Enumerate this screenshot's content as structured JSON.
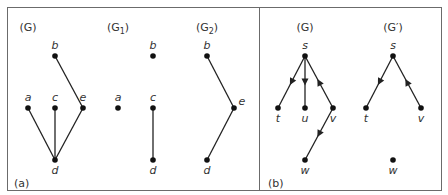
{
  "colors": {
    "border": "#6b6b6b",
    "edge": "#222222",
    "node": "#111111",
    "text": "#333333"
  },
  "panels": [
    {
      "id": "a",
      "caption": "(a)",
      "caption_pos": [
        14,
        178
      ],
      "frame": [
        7,
        7,
        259,
        190
      ]
    },
    {
      "id": "b",
      "caption": "(b)",
      "caption_pos": [
        268,
        178
      ],
      "frame": [
        259,
        7,
        441,
        190
      ]
    }
  ],
  "graphs": [
    {
      "title": "(G)",
      "title_main": "(G",
      "title_sub": "",
      "title_end": ")",
      "title_pos": [
        28,
        22
      ],
      "nodes": [
        {
          "id": "b",
          "x": 55,
          "y": 56,
          "label_pos": "above"
        },
        {
          "id": "a",
          "x": 28,
          "y": 108,
          "label_pos": "above"
        },
        {
          "id": "c",
          "x": 55,
          "y": 108,
          "label_pos": "above"
        },
        {
          "id": "e",
          "x": 83,
          "y": 108,
          "label_pos": "above"
        },
        {
          "id": "d",
          "x": 55,
          "y": 160,
          "label_pos": "below"
        }
      ],
      "edges": [
        {
          "from": "b",
          "to": "e",
          "directed": false
        },
        {
          "from": "a",
          "to": "d",
          "directed": false
        },
        {
          "from": "c",
          "to": "d",
          "directed": false
        },
        {
          "from": "e",
          "to": "d",
          "directed": false
        }
      ]
    },
    {
      "title": "(G1)",
      "title_main": "(G",
      "title_sub": "1",
      "title_end": ")",
      "title_pos": [
        118,
        22
      ],
      "nodes": [
        {
          "id": "b",
          "x": 153,
          "y": 56,
          "label_pos": "above"
        },
        {
          "id": "a",
          "x": 118,
          "y": 108,
          "label_pos": "above"
        },
        {
          "id": "c",
          "x": 153,
          "y": 108,
          "label_pos": "above"
        },
        {
          "id": "d",
          "x": 153,
          "y": 160,
          "label_pos": "below"
        }
      ],
      "edges": [
        {
          "from": "c",
          "to": "d",
          "directed": false
        }
      ]
    },
    {
      "title": "(G2)",
      "title_main": "(G",
      "title_sub": "2",
      "title_end": ")",
      "title_pos": [
        207,
        22
      ],
      "nodes": [
        {
          "id": "b",
          "x": 207,
          "y": 56,
          "label_pos": "above"
        },
        {
          "id": "e",
          "x": 234,
          "y": 108,
          "label_pos": "right"
        },
        {
          "id": "d",
          "x": 207,
          "y": 160,
          "label_pos": "below"
        }
      ],
      "edges": [
        {
          "from": "b",
          "to": "e",
          "directed": false
        },
        {
          "from": "e",
          "to": "d",
          "directed": false
        }
      ]
    },
    {
      "title": "(G)",
      "title_main": "(G",
      "title_sub": "",
      "title_end": ")",
      "title_pos": [
        305,
        22
      ],
      "nodes": [
        {
          "id": "s",
          "x": 305,
          "y": 56,
          "label_pos": "above"
        },
        {
          "id": "t",
          "x": 278,
          "y": 108,
          "label_pos": "below"
        },
        {
          "id": "u",
          "x": 305,
          "y": 108,
          "label_pos": "below"
        },
        {
          "id": "v",
          "x": 333,
          "y": 108,
          "label_pos": "below"
        },
        {
          "id": "w",
          "x": 305,
          "y": 160,
          "label_pos": "below"
        }
      ],
      "edges": [
        {
          "from": "s",
          "to": "t",
          "directed": true
        },
        {
          "from": "s",
          "to": "u",
          "directed": true
        },
        {
          "from": "v",
          "to": "s",
          "directed": true
        },
        {
          "from": "v",
          "to": "w",
          "directed": true
        }
      ]
    },
    {
      "title": "(G′)",
      "title_main": "(G′",
      "title_sub": "",
      "title_end": ")",
      "title_pos": [
        393,
        22
      ],
      "nodes": [
        {
          "id": "s",
          "x": 393,
          "y": 56,
          "label_pos": "above"
        },
        {
          "id": "t",
          "x": 366,
          "y": 108,
          "label_pos": "below"
        },
        {
          "id": "v",
          "x": 421,
          "y": 108,
          "label_pos": "below"
        },
        {
          "id": "w",
          "x": 393,
          "y": 160,
          "label_pos": "below"
        }
      ],
      "edges": [
        {
          "from": "s",
          "to": "t",
          "directed": true
        },
        {
          "from": "v",
          "to": "s",
          "directed": true
        }
      ]
    }
  ]
}
